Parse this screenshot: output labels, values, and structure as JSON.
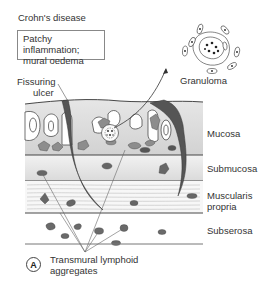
{
  "figure": {
    "title": "Crohn's disease",
    "summary_box": [
      "Patchy inflammation;",
      "mural oedema"
    ],
    "panel_label": "A",
    "annotations": {
      "fissuring_ulcer": [
        "Fissuring",
        "ulcer"
      ],
      "granuloma": "Granuloma",
      "lymphoid": [
        "Transmural lymphoid",
        "aggregates"
      ]
    },
    "layers": [
      {
        "name": "Mucosa"
      },
      {
        "name": "Submucosa"
      },
      {
        "name": "Muscularis",
        "name2": "propria"
      },
      {
        "name": "Subserosa"
      }
    ],
    "colors": {
      "ulcer": "#555555",
      "aggregate": "#6a6a6a",
      "mucosa_fill": "#dcdcdc",
      "submucosa_fill": "#e8e8e8",
      "line": "#333333"
    }
  }
}
